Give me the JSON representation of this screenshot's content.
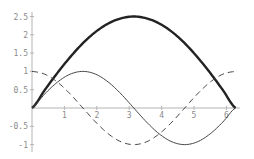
{
  "chart_data": {
    "type": "line",
    "title": "",
    "xlabel": "",
    "ylabel": "",
    "xlim": [
      0,
      6.2832
    ],
    "ylim": [
      -1,
      2.6
    ],
    "grid": false,
    "legend": null,
    "x_ticks": [
      1,
      2,
      3,
      4,
      5,
      6
    ],
    "x_tick_labels": [
      "1",
      "2",
      "3",
      "4",
      "5",
      "6"
    ],
    "y_ticks": [
      2.5,
      2,
      1.5,
      1,
      0.5,
      -0.5,
      -1
    ],
    "y_tick_labels": [
      "2.5",
      "2",
      "1.5",
      "1",
      "0.5",
      "-0.5",
      "-1"
    ],
    "x": [
      0,
      0.3927,
      0.7854,
      1.1781,
      1.5708,
      1.9635,
      2.3562,
      2.7489,
      3.1416,
      3.5343,
      3.927,
      4.3197,
      4.7124,
      5.1051,
      5.4978,
      5.8905,
      6.2832
    ],
    "series": [
      {
        "name": "thick-arch",
        "style": "solid-thick",
        "color": "#222222",
        "values": [
          0,
          0.49,
          0.96,
          1.39,
          1.77,
          2.08,
          2.31,
          2.45,
          2.5,
          2.45,
          2.31,
          2.08,
          1.77,
          1.39,
          0.96,
          0.49,
          0
        ]
      },
      {
        "name": "sin",
        "style": "solid-thin",
        "color": "#444444",
        "values": [
          0,
          0.383,
          0.707,
          0.924,
          1,
          0.924,
          0.707,
          0.383,
          0,
          -0.383,
          -0.707,
          -0.924,
          -1,
          -0.924,
          -0.707,
          -0.383,
          0
        ]
      },
      {
        "name": "cos",
        "style": "dashed",
        "color": "#444444",
        "values": [
          1,
          0.924,
          0.707,
          0.383,
          0,
          -0.383,
          -0.707,
          -0.924,
          -1,
          -0.924,
          -0.707,
          -0.383,
          0,
          0.383,
          0.707,
          0.924,
          1
        ]
      }
    ]
  }
}
